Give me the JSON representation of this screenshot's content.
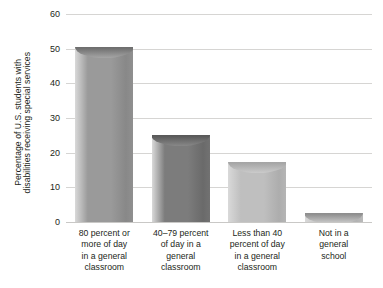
{
  "chart_data": {
    "type": "bar",
    "title": "",
    "subtitle": "",
    "xlabel": "",
    "ylabel": "Percentage of U.S. students with disabilities receiving special services",
    "ylabel_lines": [
      "Percentage of U.S. students with",
      "disabilities receiving special services"
    ],
    "ylim": [
      0,
      60
    ],
    "yticks": [
      0,
      10,
      20,
      30,
      40,
      50,
      60
    ],
    "ytick_labels": [
      "0",
      "10",
      "20",
      "30",
      "40",
      "50",
      "60"
    ],
    "grid": true,
    "grid_color": "#d6d5d3",
    "legend": null,
    "legend_position": "none",
    "categories": [
      "80 percent or more of day in a general classroom",
      "40–79 percent of day in a general classroom",
      "Less than 40 percent of day in a general classroom",
      "Not in a general school"
    ],
    "category_lines": [
      [
        "80 percent or",
        "more of day",
        "in a general",
        "classroom"
      ],
      [
        "40–79 percent",
        "of day in a",
        "general",
        "classroom"
      ],
      [
        "Less than 40",
        "percent of day",
        "in a general",
        "classroom"
      ],
      [
        "Not in a",
        "general",
        "school"
      ]
    ],
    "values": [
      50.4,
      25.1,
      17.3,
      2.7
    ],
    "bar_colors": [
      "#9a9a9a",
      "#7c7c7c",
      "#bfbfbf",
      "#c4c4c4"
    ],
    "bar_cap_colors": [
      "#6f6f6f",
      "#5a5a5a",
      "#a6a6a6",
      "#8f8f8f"
    ]
  }
}
